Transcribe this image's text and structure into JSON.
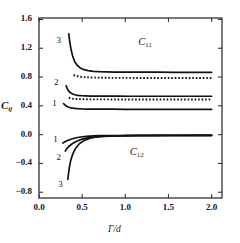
{
  "figure": {
    "background_color": "#ffffff",
    "line_color": "#111111",
    "frame_color": "#333333"
  },
  "axis": {
    "y_label_main": "C",
    "y_label_sub": "ij",
    "x_label": "Γ/d",
    "y_ticks": [
      "1.6",
      "1.2",
      "0.8",
      "0.4",
      "0.0",
      "−0.4",
      "−0.8"
    ],
    "y_tick_values": [
      1.6,
      1.2,
      0.8,
      0.4,
      0.0,
      -0.4,
      -0.8
    ],
    "x_ticks": [
      "0.0",
      "0.5",
      "1.0",
      "1.5",
      "2.0"
    ],
    "x_tick_values": [
      0.0,
      0.5,
      1.0,
      1.5,
      2.0
    ]
  },
  "annotations": {
    "group_upper_main": "C",
    "group_upper_sub": "11",
    "group_lower_main": "C",
    "group_lower_sub": "12",
    "curve_labels_upper": [
      "1",
      "2",
      "3"
    ],
    "curve_labels_lower": [
      "1",
      "2",
      "3"
    ]
  },
  "chart_data": {
    "type": "line",
    "title": "",
    "xlabel": "Γ/d",
    "ylabel": "C_ij",
    "xlim": [
      0.0,
      2.12
    ],
    "ylim": [
      -0.88,
      1.62
    ],
    "grid": false,
    "legend": "none",
    "xticks": [
      0.0,
      0.5,
      1.0,
      1.5,
      2.0
    ],
    "yticks": [
      1.6,
      1.2,
      0.8,
      0.4,
      0.0,
      -0.4,
      -0.8
    ],
    "annotations": [
      {
        "text": "C11",
        "x": 1.15,
        "y": 1.27
      },
      {
        "text": "C12",
        "x": 1.05,
        "y": -0.26
      },
      {
        "text": "3",
        "x": 0.25,
        "y": 1.3
      },
      {
        "text": "2",
        "x": 0.22,
        "y": 0.72
      },
      {
        "text": "1",
        "x": 0.2,
        "y": 0.43
      },
      {
        "text": "1",
        "x": 0.21,
        "y": -0.07
      },
      {
        "text": "2",
        "x": 0.25,
        "y": -0.32
      },
      {
        "text": "3",
        "x": 0.27,
        "y": -0.7
      }
    ],
    "series": [
      {
        "name": "C11 curve 3 (solid)",
        "style": "solid",
        "group": "C11",
        "label": "3",
        "x": [
          0.345,
          0.355,
          0.37,
          0.39,
          0.415,
          0.445,
          0.48,
          0.52,
          0.57,
          0.63,
          0.7,
          0.78,
          0.88,
          1.0,
          1.15,
          1.35,
          1.6,
          1.85,
          2.0
        ],
        "y": [
          1.4,
          1.3,
          1.19,
          1.09,
          1.01,
          0.96,
          0.925,
          0.902,
          0.888,
          0.879,
          0.874,
          0.871,
          0.869,
          0.868,
          0.867,
          0.867,
          0.866,
          0.866,
          0.866
        ]
      },
      {
        "name": "C11 curve 3 (dotted)",
        "style": "dotted",
        "group": "C11",
        "label": "3",
        "x": [
          0.4,
          0.43,
          0.47,
          0.52,
          0.58,
          0.65,
          0.73,
          0.82,
          0.93,
          1.06,
          1.2,
          1.4,
          1.65,
          1.85,
          2.0
        ],
        "y": [
          0.828,
          0.816,
          0.806,
          0.799,
          0.795,
          0.792,
          0.79,
          0.789,
          0.788,
          0.788,
          0.787,
          0.787,
          0.787,
          0.787,
          0.787
        ]
      },
      {
        "name": "C11 curve 2 (solid)",
        "style": "solid",
        "group": "C11",
        "label": "2",
        "x": [
          0.315,
          0.325,
          0.34,
          0.36,
          0.385,
          0.415,
          0.45,
          0.49,
          0.54,
          0.6,
          0.68,
          0.78,
          0.9,
          1.05,
          1.25,
          1.5,
          1.75,
          2.0
        ],
        "y": [
          0.68,
          0.645,
          0.612,
          0.586,
          0.567,
          0.554,
          0.546,
          0.541,
          0.538,
          0.536,
          0.535,
          0.534,
          0.534,
          0.533,
          0.533,
          0.533,
          0.533,
          0.533
        ]
      },
      {
        "name": "C11 curve 2 (dotted)",
        "style": "dotted",
        "group": "C11",
        "label": "2",
        "x": [
          0.345,
          0.37,
          0.4,
          0.44,
          0.49,
          0.55,
          0.63,
          0.72,
          0.83,
          0.96,
          1.12,
          1.32,
          1.55,
          1.8,
          2.0
        ],
        "y": [
          0.512,
          0.503,
          0.497,
          0.494,
          0.492,
          0.491,
          0.49,
          0.49,
          0.489,
          0.489,
          0.489,
          0.489,
          0.489,
          0.489,
          0.489
        ]
      },
      {
        "name": "C11 curve 1 (solid)",
        "style": "solid",
        "group": "C11",
        "label": "1",
        "x": [
          0.285,
          0.3,
          0.32,
          0.345,
          0.375,
          0.41,
          0.45,
          0.5,
          0.56,
          0.64,
          0.74,
          0.86,
          1.0,
          1.2,
          1.45,
          1.72,
          2.0
        ],
        "y": [
          0.43,
          0.412,
          0.395,
          0.381,
          0.371,
          0.364,
          0.36,
          0.357,
          0.355,
          0.354,
          0.353,
          0.353,
          0.352,
          0.352,
          0.352,
          0.352,
          0.352
        ]
      },
      {
        "name": "C12 curve 1",
        "style": "solid",
        "group": "C12",
        "label": "1",
        "x": [
          0.275,
          0.3,
          0.33,
          0.37,
          0.42,
          0.48,
          0.55,
          0.63,
          0.72,
          0.82,
          0.94,
          1.08,
          1.25,
          1.45,
          1.7,
          2.0
        ],
        "y": [
          -0.118,
          -0.1,
          -0.082,
          -0.064,
          -0.047,
          -0.033,
          -0.024,
          -0.018,
          -0.015,
          -0.013,
          -0.012,
          -0.011,
          -0.011,
          -0.01,
          -0.01,
          -0.01
        ]
      },
      {
        "name": "C12 curve 2",
        "style": "solid",
        "group": "C12",
        "label": "2",
        "x": [
          0.305,
          0.32,
          0.345,
          0.38,
          0.425,
          0.48,
          0.55,
          0.63,
          0.73,
          0.85,
          0.98,
          1.14,
          1.32,
          1.55,
          1.78,
          2.0
        ],
        "y": [
          -0.228,
          -0.198,
          -0.165,
          -0.13,
          -0.098,
          -0.07,
          -0.049,
          -0.035,
          -0.026,
          -0.02,
          -0.016,
          -0.014,
          -0.013,
          -0.012,
          -0.011,
          -0.011
        ]
      },
      {
        "name": "C12 curve 3",
        "style": "solid",
        "group": "C12",
        "label": "3",
        "x": [
          0.335,
          0.34,
          0.35,
          0.365,
          0.39,
          0.425,
          0.47,
          0.525,
          0.59,
          0.67,
          0.77,
          0.89,
          1.03,
          1.2,
          1.42,
          1.68,
          2.0
        ],
        "y": [
          -0.62,
          -0.56,
          -0.47,
          -0.37,
          -0.272,
          -0.188,
          -0.124,
          -0.079,
          -0.05,
          -0.032,
          -0.022,
          -0.017,
          -0.014,
          -0.012,
          -0.011,
          -0.011,
          -0.011
        ]
      }
    ]
  }
}
